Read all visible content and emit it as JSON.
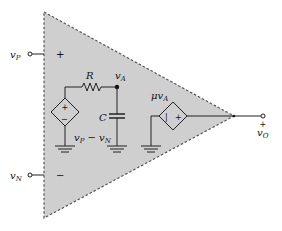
{
  "diagram": {
    "colors": {
      "triangle_fill": "#cfcfcf",
      "triangle_border": "#555555",
      "wire": "#222222",
      "background": "#ffffff"
    },
    "terminals": {
      "noninverting": {
        "label": "v",
        "subscript": "P",
        "polarity": "+"
      },
      "inverting": {
        "label": "v",
        "subscript": "N",
        "polarity": "−"
      },
      "output": {
        "label": "v",
        "subscript": "O",
        "polarity": "+"
      }
    },
    "components": {
      "input_source": {
        "type": "voltage-controlled voltage source",
        "plus": "+",
        "minus": "−",
        "expression_main": "v",
        "expression_sub1": "P",
        "expression_mid": " − v",
        "expression_sub2": "N"
      },
      "resistor": {
        "label": "R"
      },
      "capacitor": {
        "label": "C"
      },
      "node_A": {
        "label": "v",
        "subscript": "A"
      },
      "output_source": {
        "type": "voltage-controlled voltage source",
        "gain_prefix": "μv",
        "gain_sub": "A",
        "left_mark": "|",
        "right_mark": "+"
      }
    }
  }
}
